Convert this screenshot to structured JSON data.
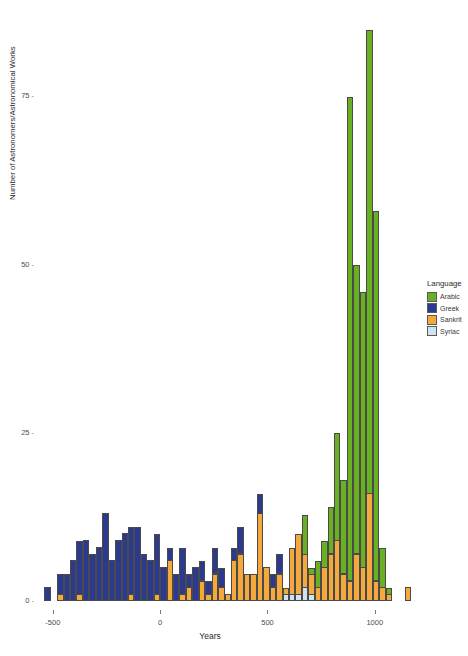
{
  "chart_data": {
    "type": "bar",
    "subtype": "stacked-histogram",
    "title": "",
    "xlabel": "Years",
    "ylabel": "Number of Astronomers/Astronomical Works",
    "xlim": [
      -560,
      1220
    ],
    "ylim": [
      0,
      88
    ],
    "xticks": [
      -500,
      0,
      500,
      1000
    ],
    "xticklabels": [
      "-500",
      "0",
      "500",
      "1000"
    ],
    "yticks": [
      0,
      25,
      50,
      75
    ],
    "yticklabels": [
      "0",
      "25",
      "50",
      "75"
    ],
    "grid": false,
    "bin_width": 30,
    "legend": {
      "title": "Language",
      "position": "right",
      "entries": [
        {
          "name": "Arabic",
          "color": "#6ab023"
        },
        {
          "name": "Greek",
          "color": "#2b3a8f"
        },
        {
          "name": "Sankrit",
          "color": "#f5a83c"
        },
        {
          "name": "Syriac",
          "color": "#cfe4ee"
        }
      ]
    },
    "series": [
      {
        "name": "Arabic",
        "color": "#6ab023"
      },
      {
        "name": "Greek",
        "color": "#2b3a8f"
      },
      {
        "name": "Sankrit",
        "color": "#f5a83c"
      },
      {
        "name": "Syriac",
        "color": "#cfe4ee"
      }
    ],
    "bins": [
      {
        "x": -540,
        "Greek": 2,
        "Sankrit": 0,
        "Arabic": 0,
        "Syriac": 0
      },
      {
        "x": -510,
        "Greek": 0,
        "Sankrit": 0,
        "Arabic": 0,
        "Syriac": 0
      },
      {
        "x": -480,
        "Greek": 3,
        "Sankrit": 1,
        "Arabic": 0,
        "Syriac": 0
      },
      {
        "x": -450,
        "Greek": 4,
        "Sankrit": 0,
        "Arabic": 0,
        "Syriac": 0
      },
      {
        "x": -420,
        "Greek": 6,
        "Sankrit": 0,
        "Arabic": 0,
        "Syriac": 0
      },
      {
        "x": -390,
        "Greek": 8,
        "Sankrit": 1,
        "Arabic": 0,
        "Syriac": 0
      },
      {
        "x": -360,
        "Greek": 9,
        "Sankrit": 0,
        "Arabic": 0,
        "Syriac": 0
      },
      {
        "x": -330,
        "Greek": 7,
        "Sankrit": 0,
        "Arabic": 0,
        "Syriac": 0
      },
      {
        "x": -300,
        "Greek": 8,
        "Sankrit": 0,
        "Arabic": 0,
        "Syriac": 0
      },
      {
        "x": -270,
        "Greek": 13,
        "Sankrit": 0,
        "Arabic": 0,
        "Syriac": 0
      },
      {
        "x": -240,
        "Greek": 6,
        "Sankrit": 0,
        "Arabic": 0,
        "Syriac": 0
      },
      {
        "x": -210,
        "Greek": 9,
        "Sankrit": 0,
        "Arabic": 0,
        "Syriac": 0
      },
      {
        "x": -180,
        "Greek": 10,
        "Sankrit": 0,
        "Arabic": 0,
        "Syriac": 0
      },
      {
        "x": -150,
        "Greek": 10,
        "Sankrit": 1,
        "Arabic": 0,
        "Syriac": 0
      },
      {
        "x": -120,
        "Greek": 11,
        "Sankrit": 0,
        "Arabic": 0,
        "Syriac": 0
      },
      {
        "x": -90,
        "Greek": 7,
        "Sankrit": 0,
        "Arabic": 0,
        "Syriac": 0
      },
      {
        "x": -60,
        "Greek": 6,
        "Sankrit": 0,
        "Arabic": 0,
        "Syriac": 0
      },
      {
        "x": -30,
        "Greek": 9,
        "Sankrit": 1,
        "Arabic": 0,
        "Syriac": 0
      },
      {
        "x": 0,
        "Greek": 5,
        "Sankrit": 0,
        "Arabic": 0,
        "Syriac": 0
      },
      {
        "x": 30,
        "Greek": 2,
        "Sankrit": 6,
        "Arabic": 0,
        "Syriac": 0
      },
      {
        "x": 60,
        "Greek": 4,
        "Sankrit": 0,
        "Arabic": 0,
        "Syriac": 0
      },
      {
        "x": 90,
        "Greek": 7,
        "Sankrit": 1,
        "Arabic": 0,
        "Syriac": 0
      },
      {
        "x": 120,
        "Greek": 2,
        "Sankrit": 2,
        "Arabic": 0,
        "Syriac": 0
      },
      {
        "x": 150,
        "Greek": 5,
        "Sankrit": 0,
        "Arabic": 0,
        "Syriac": 0
      },
      {
        "x": 180,
        "Greek": 3,
        "Sankrit": 3,
        "Arabic": 0,
        "Syriac": 0
      },
      {
        "x": 210,
        "Greek": 2,
        "Sankrit": 1,
        "Arabic": 0,
        "Syriac": 0
      },
      {
        "x": 240,
        "Greek": 4,
        "Sankrit": 4,
        "Arabic": 0,
        "Syriac": 0
      },
      {
        "x": 270,
        "Greek": 3,
        "Sankrit": 2,
        "Arabic": 0,
        "Syriac": 0
      },
      {
        "x": 300,
        "Greek": 0,
        "Sankrit": 1,
        "Arabic": 0,
        "Syriac": 0
      },
      {
        "x": 330,
        "Greek": 2,
        "Sankrit": 6,
        "Arabic": 0,
        "Syriac": 0
      },
      {
        "x": 360,
        "Greek": 4,
        "Sankrit": 7,
        "Arabic": 0,
        "Syriac": 0
      },
      {
        "x": 390,
        "Greek": 0,
        "Sankrit": 4,
        "Arabic": 0,
        "Syriac": 0
      },
      {
        "x": 420,
        "Greek": 0,
        "Sankrit": 4,
        "Arabic": 0,
        "Syriac": 0
      },
      {
        "x": 450,
        "Greek": 3,
        "Sankrit": 13,
        "Arabic": 0,
        "Syriac": 0
      },
      {
        "x": 480,
        "Greek": 0,
        "Sankrit": 5,
        "Arabic": 0,
        "Syriac": 0
      },
      {
        "x": 510,
        "Greek": 2,
        "Sankrit": 2,
        "Arabic": 0,
        "Syriac": 0
      },
      {
        "x": 540,
        "Greek": 3,
        "Sankrit": 4,
        "Arabic": 0,
        "Syriac": 0
      },
      {
        "x": 570,
        "Greek": 0,
        "Sankrit": 1,
        "Arabic": 0,
        "Syriac": 1
      },
      {
        "x": 600,
        "Greek": 0,
        "Sankrit": 7,
        "Arabic": 0,
        "Syriac": 1
      },
      {
        "x": 630,
        "Greek": 0,
        "Sankrit": 9,
        "Arabic": 0,
        "Syriac": 1
      },
      {
        "x": 660,
        "Greek": 0,
        "Sankrit": 5,
        "Arabic": 6,
        "Syriac": 2
      },
      {
        "x": 690,
        "Greek": 0,
        "Sankrit": 3,
        "Arabic": 1,
        "Syriac": 1
      },
      {
        "x": 720,
        "Greek": 0,
        "Sankrit": 2,
        "Arabic": 4,
        "Syriac": 0
      },
      {
        "x": 750,
        "Greek": 0,
        "Sankrit": 5,
        "Arabic": 4,
        "Syriac": 0
      },
      {
        "x": 780,
        "Greek": 0,
        "Sankrit": 7,
        "Arabic": 7,
        "Syriac": 0
      },
      {
        "x": 810,
        "Greek": 0,
        "Sankrit": 9,
        "Arabic": 16,
        "Syriac": 0
      },
      {
        "x": 840,
        "Greek": 0,
        "Sankrit": 4,
        "Arabic": 14,
        "Syriac": 0
      },
      {
        "x": 870,
        "Greek": 0,
        "Sankrit": 3,
        "Arabic": 72,
        "Syriac": 0
      },
      {
        "x": 900,
        "Greek": 0,
        "Sankrit": 7,
        "Arabic": 43,
        "Syriac": 0
      },
      {
        "x": 930,
        "Greek": 0,
        "Sankrit": 5,
        "Arabic": 41,
        "Syriac": 0
      },
      {
        "x": 960,
        "Greek": 0,
        "Sankrit": 16,
        "Arabic": 69,
        "Syriac": 0
      },
      {
        "x": 990,
        "Greek": 0,
        "Sankrit": 3,
        "Arabic": 55,
        "Syriac": 0
      },
      {
        "x": 1020,
        "Greek": 0,
        "Sankrit": 2,
        "Arabic": 6,
        "Syriac": 0
      },
      {
        "x": 1050,
        "Greek": 0,
        "Sankrit": 1,
        "Arabic": 1,
        "Syriac": 0
      },
      {
        "x": 1080,
        "Greek": 0,
        "Sankrit": 0,
        "Arabic": 0,
        "Syriac": 0
      },
      {
        "x": 1110,
        "Greek": 0,
        "Sankrit": 0,
        "Arabic": 0,
        "Syriac": 0
      },
      {
        "x": 1140,
        "Greek": 0,
        "Sankrit": 2,
        "Arabic": 0,
        "Syriac": 0
      }
    ]
  }
}
